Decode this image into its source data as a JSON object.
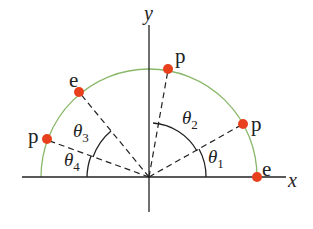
{
  "diagram": {
    "axes": {
      "x_label": "x",
      "y_label": "y",
      "origin": [
        149,
        177
      ],
      "x_range": [
        22,
        286
      ],
      "y_range": [
        25,
        212
      ],
      "color": "#222222"
    },
    "arc": {
      "type": "semicircle",
      "radius": 108,
      "color": "#8ab86a"
    },
    "point_color": "#e8401c",
    "points": [
      {
        "id": "e-right",
        "label": "e",
        "angle_deg": 0
      },
      {
        "id": "p-right",
        "label": "p",
        "angle_deg": 31
      },
      {
        "id": "p-top",
        "label": "p",
        "angle_deg": 80
      },
      {
        "id": "e-left",
        "label": "e",
        "angle_deg": 128
      },
      {
        "id": "p-left",
        "label": "p",
        "angle_deg": 162
      }
    ],
    "angles": [
      {
        "id": "theta1",
        "symbol": "θ",
        "subscript": "1",
        "from": "x-axis",
        "to": "p-right"
      },
      {
        "id": "theta2",
        "symbol": "θ",
        "subscript": "2",
        "from": "p-right",
        "to": "p-top"
      },
      {
        "id": "theta3",
        "symbol": "θ",
        "subscript": "3",
        "from": "e-left",
        "to": "p-left"
      },
      {
        "id": "theta4",
        "symbol": "θ",
        "subscript": "4",
        "from": "p-left",
        "to": "negative-x-axis"
      }
    ]
  }
}
